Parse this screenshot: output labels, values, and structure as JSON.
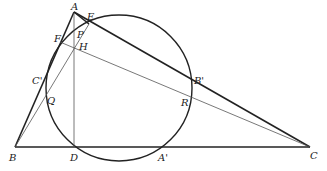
{
  "diagram": {
    "points": {
      "A": {
        "label": "A",
        "x": 74,
        "y": 12
      },
      "B": {
        "label": "B",
        "x": 15,
        "y": 147
      },
      "C": {
        "label": "C",
        "x": 310,
        "y": 147
      },
      "D": {
        "label": "D",
        "x": 74,
        "y": 147
      },
      "E": {
        "label": "E",
        "x": 89,
        "y": 24
      },
      "F": {
        "label": "F",
        "x": 60,
        "y": 42
      },
      "H": {
        "label": "H",
        "x": 74,
        "y": 51
      },
      "P": {
        "label": "P",
        "x": 77,
        "y": 37
      },
      "Q": {
        "label": "Q",
        "x": 45,
        "y": 96
      },
      "R": {
        "label": "R",
        "x": 191,
        "y": 104
      },
      "A'": {
        "label": "A'",
        "x": 162,
        "y": 147
      },
      "B'": {
        "label": "B'",
        "x": 192,
        "y": 86
      },
      "C'": {
        "label": "C'",
        "x": 44,
        "y": 80
      }
    },
    "circle": {
      "cx": 119,
      "cy": 88,
      "r": 73
    },
    "colors": {
      "stroke": "#222222",
      "thin": "#555555",
      "background": "#ffffff"
    }
  }
}
